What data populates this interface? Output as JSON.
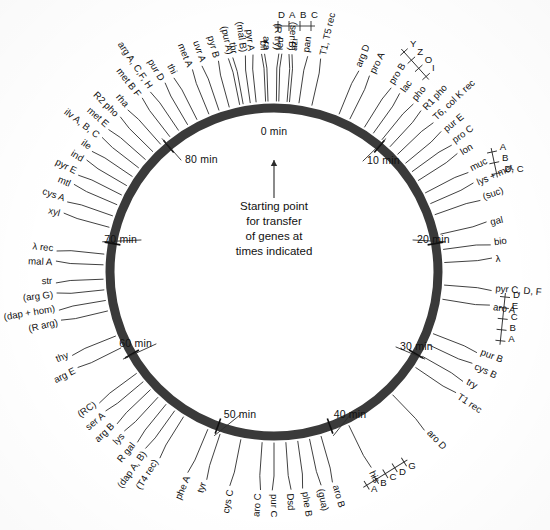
{
  "figure": {
    "ring_color": "#3a3a3a",
    "background": "#ffffff",
    "total_minutes": 90
  },
  "center_note": {
    "lines": [
      "Starting point",
      "for transfer",
      "of genes at",
      "times indicated"
    ],
    "arrow_target_minute": 0
  },
  "time_ticks": [
    {
      "label": "0 min",
      "minute": 0
    },
    {
      "label": "10 min",
      "minute": 10
    },
    {
      "label": "20 min",
      "minute": 20
    },
    {
      "label": "30 min",
      "minute": 30
    },
    {
      "label": "40 min",
      "minute": 40
    },
    {
      "label": "50 min",
      "minute": 50
    },
    {
      "label": "60 min",
      "minute": 60
    },
    {
      "label": "70 min",
      "minute": 70
    },
    {
      "label": "80 min",
      "minute": 80
    }
  ],
  "genes": [
    {
      "label": "thr",
      "minute": -2.6
    },
    {
      "label": "pyr A",
      "minute": -1.5
    },
    {
      "label": "ara",
      "minute": -0.5
    },
    {
      "label": "leu",
      "minute": 0.4
    },
    {
      "label": "azi",
      "minute": 1.3
    },
    {
      "label": "pan",
      "minute": 2.1
    },
    {
      "label": "T1, T5 rec",
      "minute": 3.2
    },
    {
      "label": "arg D",
      "minute": 5.6
    },
    {
      "label": "pro A",
      "minute": 6.6
    },
    {
      "label": "pro B",
      "minute": 8.0
    },
    {
      "label": "lac",
      "minute": 8.9
    },
    {
      "label": "pho",
      "minute": 9.8
    },
    {
      "label": "R1 pho",
      "minute": 10.7
    },
    {
      "label": "T6, col K rec",
      "minute": 11.6
    },
    {
      "label": "pur E",
      "minute": 12.6
    },
    {
      "label": "pro C",
      "minute": 13.5
    },
    {
      "label": "lon",
      "minute": 14.4
    },
    {
      "label": "muc",
      "minute": 15.6
    },
    {
      "label": "lys + met",
      "minute": 16.6
    },
    {
      "label": "(suc)",
      "minute": 17.6
    },
    {
      "label": "gal",
      "minute": 19.3
    },
    {
      "label": "bio",
      "minute": 20.6
    },
    {
      "label": "λ",
      "minute": 21.7
    },
    {
      "label": "pyr C, D, F",
      "minute": 23.6
    },
    {
      "label": "aro A",
      "minute": 24.8
    },
    {
      "label": "pur B",
      "minute": 27.8
    },
    {
      "label": "cys B",
      "minute": 28.8
    },
    {
      "label": "try",
      "minute": 29.9
    },
    {
      "label": "T1 rec",
      "minute": 31.0
    },
    {
      "label": "aro D",
      "minute": 34.0
    },
    {
      "label": "his",
      "minute": 38.5
    },
    {
      "label": "aro B",
      "minute": 41.0
    },
    {
      "label": "(gua)",
      "minute": 42.0
    },
    {
      "label": "phe B",
      "minute": 43.0
    },
    {
      "label": "Dsd",
      "minute": 44.0
    },
    {
      "label": "pur C",
      "minute": 45.0
    },
    {
      "label": "aro C",
      "minute": 46.0
    },
    {
      "label": "cys C",
      "minute": 47.8
    },
    {
      "label": "tyr",
      "minute": 49.6
    },
    {
      "label": "phe A",
      "minute": 50.7
    },
    {
      "label": "(T4 rec)",
      "minute": 53.0
    },
    {
      "label": "(dap A, B)",
      "minute": 53.9
    },
    {
      "label": "R gal",
      "minute": 54.8
    },
    {
      "label": "lys",
      "minute": 55.7
    },
    {
      "label": "arg B",
      "minute": 56.6
    },
    {
      "label": "ser A",
      "minute": 57.5
    },
    {
      "label": "(RC)",
      "minute": 58.4
    },
    {
      "label": "arg E",
      "minute": 60.9
    },
    {
      "label": "thy",
      "minute": 62.0
    },
    {
      "label": "(R arg)",
      "minute": 64.2
    },
    {
      "label": "(dap + hom)",
      "minute": 65.1
    },
    {
      "label": "(arg G)",
      "minute": 66.0
    },
    {
      "label": "str",
      "minute": 66.9
    },
    {
      "label": "mal A",
      "minute": 68.1
    },
    {
      "label": "λ rec",
      "minute": 69.0
    },
    {
      "label": "xyl",
      "minute": 71.3
    },
    {
      "label": "cys A",
      "minute": 72.3
    },
    {
      "label": "mtl",
      "minute": 73.3
    },
    {
      "label": "pyr E",
      "minute": 74.2
    },
    {
      "label": "ind",
      "minute": 75.1
    },
    {
      "label": "ile",
      "minute": 76.0
    },
    {
      "label": "ilv A, B, C",
      "minute": 76.9
    },
    {
      "label": "met E",
      "minute": 77.8
    },
    {
      "label": "R2 pho",
      "minute": 78.7
    },
    {
      "label": "rha",
      "minute": 79.6
    },
    {
      "label": "met B F",
      "minute": 80.6
    },
    {
      "label": "arg A, C,F, H",
      "minute": 81.5
    },
    {
      "label": "pur D",
      "minute": 82.4
    },
    {
      "label": "thi",
      "minute": 83.3
    },
    {
      "label": "met A",
      "minute": 84.4
    },
    {
      "label": "uvr A",
      "minute": 85.3
    },
    {
      "label": "pyr B",
      "minute": 86.2
    },
    {
      "label": "(pur A)",
      "minute": 87.1
    },
    {
      "label": "(mal B)",
      "minute": 88.0
    },
    {
      "label": "bil",
      "minute": 89.3
    },
    {
      "label": "(R try)",
      "minute": 90.2
    },
    {
      "label": "(ser B)",
      "minute": 91.1
    }
  ],
  "ladders": [
    {
      "parent": "pyr A",
      "subgenes": [
        "D",
        "A",
        "B",
        "C"
      ]
    },
    {
      "parent": "lac",
      "subgenes": [
        "Y",
        "Z",
        "O",
        "I"
      ]
    },
    {
      "parent": "gal",
      "subgenes": [
        "A",
        "B",
        "D, C"
      ]
    },
    {
      "parent": "try",
      "subgenes": [
        "D",
        "E",
        "C",
        "B",
        "A"
      ]
    },
    {
      "parent": "his",
      "subgenes": [
        "G",
        "D",
        "C",
        "B",
        "A"
      ]
    }
  ]
}
